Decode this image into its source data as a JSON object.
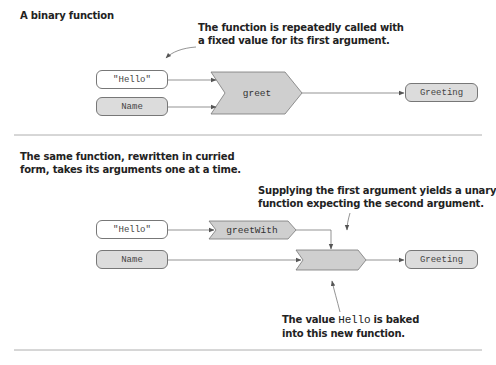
{
  "binary": {
    "title": "A binary function",
    "annotation": [
      "The function is repeatedly called with",
      "a fixed value for its first argument."
    ],
    "inputs": [
      {
        "label": "\"Hello\"",
        "style": "white"
      },
      {
        "label": "Name",
        "style": "gray"
      }
    ],
    "function": "greet",
    "output": "Greeting"
  },
  "curried": {
    "title": [
      "The same function, rewritten in curried",
      "form, takes its arguments one at a time."
    ],
    "annotation_top": [
      "Supplying the first argument yields a unary",
      "function expecting the second argument."
    ],
    "inputs": [
      {
        "label": "\"Hello\"",
        "style": "white"
      },
      {
        "label": "Name",
        "style": "gray"
      }
    ],
    "function_outer": "greetWith",
    "function_inner": "",
    "output": "Greeting",
    "annotation_bottom": {
      "prefix": "The value ",
      "code": "Hello",
      "suffix": " is baked",
      "line2": "into this new function."
    }
  },
  "colors": {
    "box_gray": "#dcdcdc",
    "chevron_fill": "#cfcfcf",
    "stroke": "#777777",
    "text": "#222222"
  }
}
